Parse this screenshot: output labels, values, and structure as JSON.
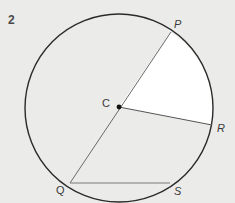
{
  "question_number": "2",
  "diagram": {
    "type": "circle-geometry",
    "circle": {
      "cx": 119,
      "cy": 108,
      "r": 94
    },
    "center": {
      "label": "C",
      "x": 119,
      "y": 107
    },
    "points": [
      {
        "label": "P",
        "x": 171,
        "y": 32
      },
      {
        "label": "R",
        "x": 212,
        "y": 125
      },
      {
        "label": "Q",
        "x": 70,
        "y": 183
      },
      {
        "label": "S",
        "x": 170,
        "y": 183
      }
    ],
    "segments": [
      {
        "from": "P",
        "to": "Q",
        "description": "diameter through C"
      },
      {
        "from": "C",
        "to": "R",
        "description": "radius"
      },
      {
        "from": "Q",
        "to": "S",
        "description": "chord"
      }
    ],
    "shaded_sector": {
      "from": "P",
      "to": "R",
      "vertex": "C",
      "fill": "#ffffff"
    },
    "colors": {
      "background": "#ebebe9",
      "circle_stroke": "#2a2a2a",
      "line_stroke": "#6a6a6a",
      "sector_fill": "#ffffff"
    }
  },
  "labels": {
    "C": "C",
    "P": "P",
    "R": "R",
    "Q": "Q",
    "S": "S"
  }
}
